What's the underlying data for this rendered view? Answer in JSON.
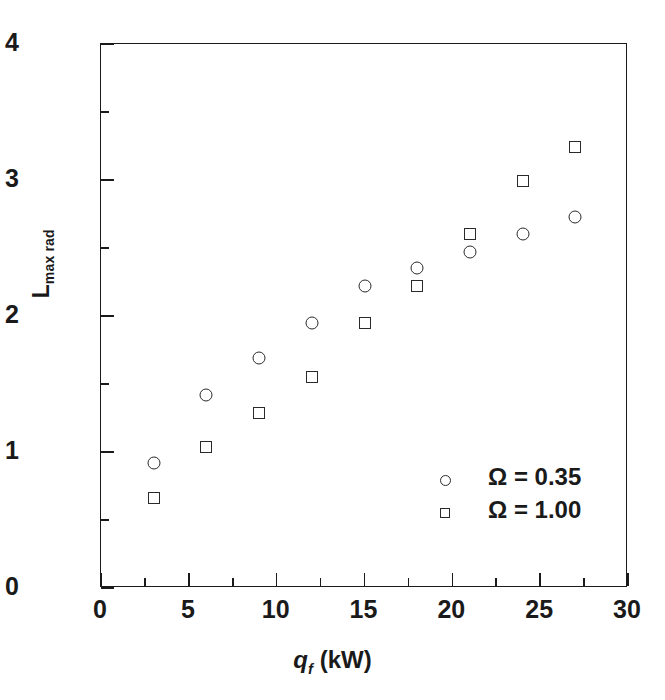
{
  "chart_data": {
    "type": "scatter",
    "title": "",
    "xlabel": "q_f (kW)",
    "xlabel_parts": {
      "symbol": "q",
      "subscript": "f",
      "units": " (kW)"
    },
    "ylabel": "L_max rad",
    "ylabel_parts": {
      "symbol": "L",
      "subscript": "max rad"
    },
    "xlim": [
      0,
      30
    ],
    "ylim": [
      0,
      4
    ],
    "xticks": [
      0,
      5,
      10,
      15,
      20,
      25,
      30
    ],
    "yticks": [
      0,
      1,
      2,
      3,
      4
    ],
    "x_minor_ticks": [
      2.5,
      7.5,
      12.5,
      17.5,
      22.5,
      27.5
    ],
    "y_minor_ticks": [
      0.5,
      1.5,
      2.5,
      3.5
    ],
    "grid": false,
    "legend_position": "lower right",
    "series": [
      {
        "name": "Ω = 0.35",
        "marker": "circle",
        "x": [
          3,
          6,
          9,
          12,
          15,
          18,
          21,
          24,
          27
        ],
        "values": [
          0.92,
          1.42,
          1.69,
          1.95,
          2.22,
          2.35,
          2.47,
          2.6,
          2.73
        ]
      },
      {
        "name": "Ω = 1.00",
        "marker": "square",
        "x": [
          3,
          6,
          9,
          12,
          15,
          18,
          21,
          24,
          27
        ],
        "values": [
          0.66,
          1.04,
          1.29,
          1.55,
          1.95,
          2.22,
          2.6,
          2.99,
          3.24
        ]
      }
    ]
  },
  "axis": {
    "x_tick_labels": [
      "0",
      "5",
      "10",
      "15",
      "20",
      "25",
      "30"
    ],
    "y_tick_labels": [
      "0",
      "1",
      "2",
      "3",
      "4"
    ],
    "y_title_symbol": "L",
    "y_title_sub": "max rad",
    "x_title_symbol": "q",
    "x_title_sub": "f",
    "x_title_units": " (kW)"
  },
  "legend": {
    "entries": [
      {
        "marker": "circle",
        "label": "Ω = 0.35"
      },
      {
        "marker": "square",
        "label": "Ω = 1.00"
      }
    ]
  },
  "colors": {
    "ink": "#1a1a1a",
    "marker": "#2a2a2a",
    "background": "#ffffff"
  }
}
